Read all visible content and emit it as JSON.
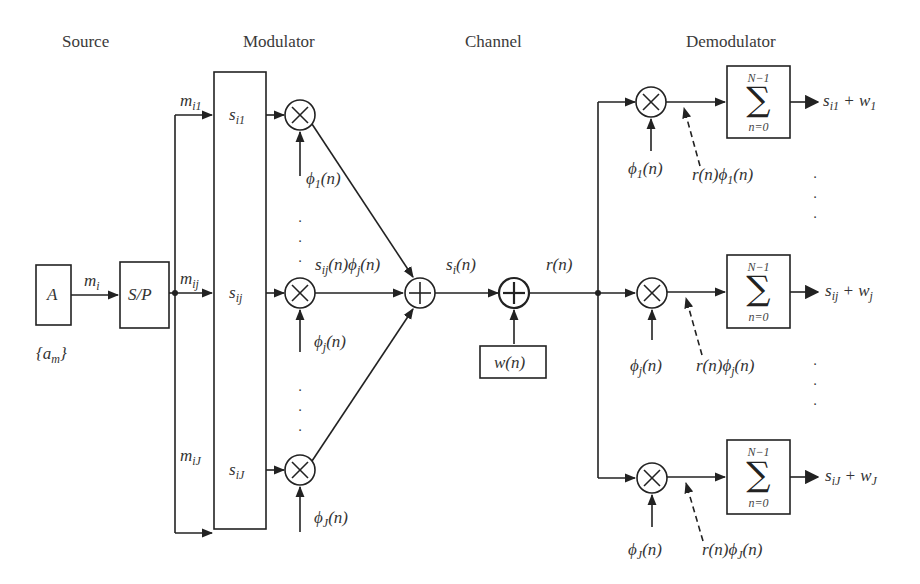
{
  "sections": {
    "source": "Source",
    "modulator": "Modulator",
    "channel": "Channel",
    "demodulator": "Demodulator"
  },
  "source": {
    "box_label": "A",
    "set_label": "{a",
    "set_sub": "m",
    "set_close": "}",
    "output_label": "m",
    "output_sub": "i"
  },
  "sp": {
    "box_label": "S/P"
  },
  "branches": [
    {
      "m": "m",
      "m_sub": "i1",
      "s": "s",
      "s_sub": "i1",
      "phi": "ϕ",
      "phi_sub": "1",
      "phi_arg": "(n)"
    },
    {
      "m": "m",
      "m_sub": "ij",
      "s": "s",
      "s_sub": "ij",
      "phi": "ϕ",
      "phi_sub": "j",
      "phi_arg": "(n)"
    },
    {
      "m": "m",
      "m_sub": "iJ",
      "s": "s",
      "s_sub": "iJ",
      "phi": "ϕ",
      "phi_sub": "J",
      "phi_arg": "(n)"
    }
  ],
  "modulator": {
    "product_label": {
      "a": "s",
      "a_sub": "ij",
      "b": "(n)ϕ",
      "b_sub": "j",
      "c": "(n)"
    }
  },
  "channel": {
    "signal_label": {
      "a": "s",
      "a_sub": "i",
      "b": "(n)"
    },
    "noise_box": "w(n)",
    "received_label": "r(n)"
  },
  "demodulator": {
    "rows": [
      {
        "phi": "ϕ",
        "phi_sub": "1",
        "phi_arg": "(n)",
        "prod_a": "r(n)ϕ",
        "prod_sub": "1",
        "prod_c": "(n)",
        "sum_top": "N−1",
        "sum_bot": "n=0",
        "sigma": "∑",
        "out_s": "s",
        "out_s_sub": "i1",
        "out_plus": " + w",
        "out_w_sub": "1"
      },
      {
        "phi": "ϕ",
        "phi_sub": "j",
        "phi_arg": "(n)",
        "prod_a": "r(n)ϕ",
        "prod_sub": "j",
        "prod_c": "(n)",
        "sum_top": "N−1",
        "sum_bot": "n=0",
        "sigma": "∑",
        "out_s": "s",
        "out_s_sub": "ij",
        "out_plus": " + w",
        "out_w_sub": "j"
      },
      {
        "phi": "ϕ",
        "phi_sub": "J",
        "phi_arg": "(n)",
        "prod_a": "r(n)ϕ",
        "prod_sub": "J",
        "prod_c": "(n)",
        "sum_top": "N−1",
        "sum_bot": "n=0",
        "sigma": "∑",
        "out_s": "s",
        "out_s_sub": "iJ",
        "out_plus": " + w",
        "out_w_sub": "J"
      }
    ]
  },
  "ellipsis": "·\n·\n·",
  "colors": {
    "stroke": "#222222",
    "text": "#333333",
    "background": "#ffffff"
  }
}
